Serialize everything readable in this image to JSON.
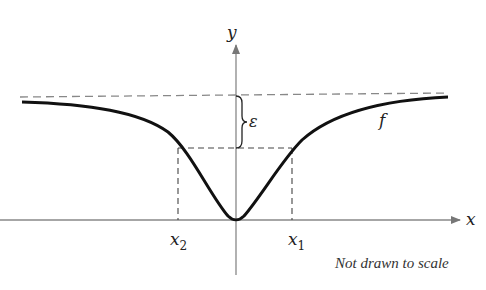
{
  "diagram": {
    "axis_labels": {
      "x": "x",
      "y": "y"
    },
    "function_label": "f",
    "epsilon_label": "ε",
    "tick_labels": {
      "x2": "x",
      "x2_sub": "2",
      "x1": "x",
      "x1_sub": "1"
    },
    "note": "Not drawn to scale",
    "colors": {
      "curve": "#111111",
      "axis": "#777777",
      "dashed": "#888888",
      "text": "#222222"
    }
  }
}
